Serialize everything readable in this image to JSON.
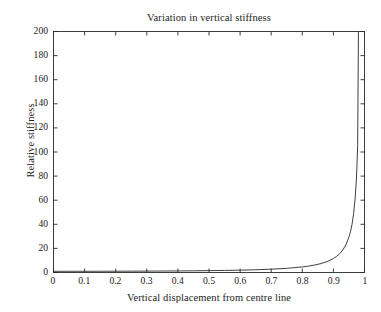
{
  "chart_data": {
    "type": "line",
    "title": "Variation in vertical stiffness",
    "xlabel": "Vertical displacement from centre line",
    "ylabel": "Relative stiffness",
    "xlim": [
      0,
      1
    ],
    "ylim": [
      0,
      200
    ],
    "grid": false,
    "legend": null,
    "xticks": [
      0,
      0.1,
      0.2,
      0.3,
      0.4,
      0.5,
      0.6,
      0.7,
      0.8,
      0.9,
      1
    ],
    "xtick_labels": [
      "0",
      "0.1",
      "0.2",
      "0.3",
      "0.4",
      "0.5",
      "0.6",
      "0.7",
      "0.8",
      "0.9",
      "1"
    ],
    "yticks": [
      0,
      20,
      40,
      60,
      80,
      100,
      120,
      140,
      160,
      180,
      200
    ],
    "ytick_labels": [
      "0",
      "20",
      "40",
      "60",
      "80",
      "100",
      "120",
      "140",
      "160",
      "180",
      "200"
    ],
    "line_color": "#2a2a2a",
    "series": [
      {
        "name": "Relative stiffness",
        "x": [
          0,
          0.05,
          0.1,
          0.15,
          0.2,
          0.25,
          0.3,
          0.35,
          0.4,
          0.45,
          0.5,
          0.55,
          0.6,
          0.65,
          0.7,
          0.75,
          0.8,
          0.82,
          0.84,
          0.86,
          0.88,
          0.9,
          0.91,
          0.92,
          0.93,
          0.94,
          0.95,
          0.955,
          0.96,
          0.965,
          0.97,
          0.973,
          0.975,
          0.977,
          0.978
        ],
        "y": [
          1,
          1.01,
          1.02,
          1.03,
          1.06,
          1.1,
          1.15,
          1.22,
          1.3,
          1.41,
          1.54,
          1.72,
          1.95,
          2.28,
          2.74,
          3.45,
          4.63,
          5.32,
          6.21,
          7.41,
          9.09,
          11.6,
          13.3,
          15.6,
          18.6,
          22.9,
          29.4,
          33.9,
          40.1,
          48.8,
          62.0,
          73.5,
          83.6,
          97.6,
          106.0
        ]
      }
    ]
  },
  "axes": {
    "box_color": "#2a2a2a",
    "tick_direction": "in"
  }
}
